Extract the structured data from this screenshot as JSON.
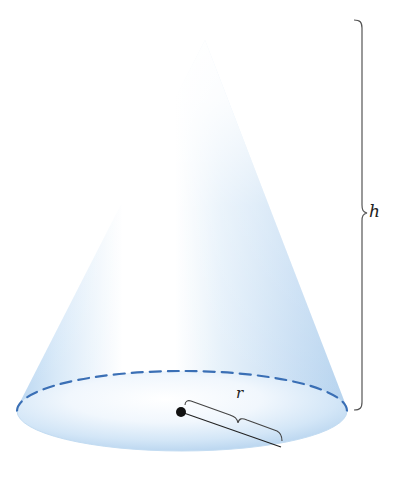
{
  "figure": {
    "labels": {
      "height": "h",
      "radius": "r"
    },
    "colors": {
      "cone_light": "#ffffff",
      "cone_tint": "#cfe3f6",
      "cone_edge": "#b4d2ee",
      "base_dashed_edge": "#3a6fb5",
      "brace_color": "#555555",
      "center_dot": "#111111"
    },
    "elements": [
      "cone-surface",
      "base-ellipse",
      "dashed-back-edge",
      "center-point",
      "radius-brace",
      "height-brace"
    ]
  }
}
